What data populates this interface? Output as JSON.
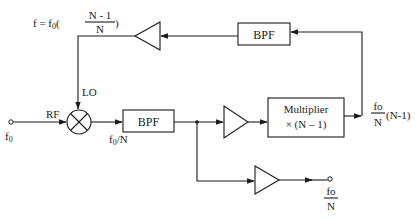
{
  "diagram": {
    "type": "block-diagram",
    "blocks": {
      "top_bpf": {
        "label": "BPF"
      },
      "main_bpf": {
        "label": "BPF"
      },
      "multiplier": {
        "line1": "Multiplier",
        "line2": "× (N – 1)"
      },
      "mixer": {
        "symbol": "⊗"
      }
    },
    "labels": {
      "feedback_freq_prefix": "f = f",
      "feedback_freq_sub": "0",
      "feedback_freq_num": "N - 1",
      "feedback_freq_den": "N",
      "paren_open": "(",
      "paren_close": ")",
      "lo": "LO",
      "rf": "RF",
      "input_f": "f",
      "input_sub": "0",
      "bpf_out_f": "f",
      "bpf_out_sub": "0",
      "bpf_out_rest": "/N",
      "mult_out_num": "fo",
      "mult_out_den": "N",
      "mult_out_factor": "(N-1)",
      "div_out_num": "fo",
      "div_out_den": "N"
    },
    "colors": {
      "ink": "#1a1a1a",
      "background": "#ffffff"
    }
  }
}
